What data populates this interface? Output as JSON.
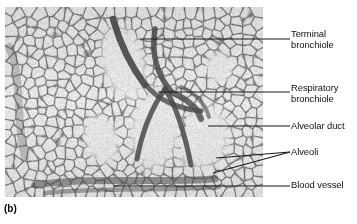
{
  "figure": {
    "panel_letter": "(b)",
    "background_color": "#ffffff",
    "micrograph": {
      "tissue_background_color": "#d9d9d7",
      "septa_color": "#6e6e6e",
      "dark_wall_color": "#4a4a4a",
      "airspace_color": "#e6e6e4",
      "left": 5,
      "top": 7,
      "width": 258,
      "height": 190
    },
    "leader_line_color": "#1a1a1a"
  },
  "labels": [
    {
      "id": "terminal-bronchiole",
      "text": "Terminal\nbronchiole",
      "leader": {
        "type": "line",
        "x1": 140,
        "y1": 39,
        "x2": 290,
        "y2": 39
      }
    },
    {
      "id": "respiratory-bronchiole",
      "text": "Respiratory\nbronchiole",
      "leader": {
        "type": "line",
        "x1": 158,
        "y1": 92,
        "x2": 290,
        "y2": 92
      }
    },
    {
      "id": "alveolar-duct",
      "text": "Alveolar duct",
      "leader": {
        "type": "line",
        "x1": 208,
        "y1": 126,
        "x2": 290,
        "y2": 126
      }
    },
    {
      "id": "alveoli",
      "text": "Alveoli",
      "leader": {
        "type": "fork",
        "apex_x": 290,
        "apex_y": 152,
        "branches": [
          {
            "x": 216,
            "y": 158
          },
          {
            "x": 213,
            "y": 173
          }
        ]
      }
    },
    {
      "id": "blood-vessel",
      "text": "Blood vessel",
      "leader": {
        "type": "line",
        "x1": 113,
        "y1": 186,
        "x2": 290,
        "y2": 186
      }
    }
  ]
}
